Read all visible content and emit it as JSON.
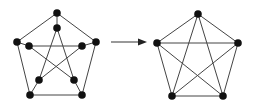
{
  "diagram": {
    "graphs": [
      {
        "name": "petersen-graph",
        "nodes": [
          "outer-top",
          "outer-left",
          "outer-right",
          "outer-bottom-left",
          "outer-bottom-right",
          "inner-top",
          "inner-left",
          "inner-right",
          "inner-bottom-left",
          "inner-bottom-right"
        ],
        "edges": [
          [
            "outer-top",
            "outer-left"
          ],
          [
            "outer-top",
            "outer-right"
          ],
          [
            "outer-left",
            "outer-bottom-left"
          ],
          [
            "outer-right",
            "outer-bottom-right"
          ],
          [
            "outer-bottom-left",
            "outer-bottom-right"
          ],
          [
            "outer-top",
            "inner-top"
          ],
          [
            "outer-left",
            "inner-left"
          ],
          [
            "outer-right",
            "inner-right"
          ],
          [
            "outer-bottom-left",
            "inner-bottom-left"
          ],
          [
            "outer-bottom-right",
            "inner-bottom-right"
          ],
          [
            "inner-top",
            "inner-bottom-left"
          ],
          [
            "inner-top",
            "inner-bottom-right"
          ],
          [
            "inner-left",
            "inner-right"
          ],
          [
            "inner-left",
            "inner-bottom-right"
          ],
          [
            "inner-right",
            "inner-bottom-left"
          ]
        ]
      },
      {
        "name": "k5-graph",
        "nodes": [
          "top",
          "left",
          "right",
          "bottom-left",
          "bottom-right"
        ],
        "edges": [
          [
            "top",
            "left"
          ],
          [
            "top",
            "right"
          ],
          [
            "top",
            "bottom-left"
          ],
          [
            "top",
            "bottom-right"
          ],
          [
            "left",
            "right"
          ],
          [
            "left",
            "bottom-left"
          ],
          [
            "left",
            "bottom-right"
          ],
          [
            "right",
            "bottom-left"
          ],
          [
            "right",
            "bottom-right"
          ],
          [
            "bottom-left",
            "bottom-right"
          ]
        ]
      }
    ],
    "arrow": {
      "from": "petersen-graph",
      "to": "k5-graph"
    }
  }
}
